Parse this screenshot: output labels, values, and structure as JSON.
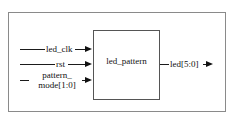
{
  "diagram": {
    "type": "block-diagram",
    "module": {
      "name": "led_pattern",
      "box": {
        "x": 93,
        "y": 30,
        "width": 67,
        "height": 70
      }
    },
    "frame": {
      "x": 8,
      "y": 12,
      "width": 218,
      "height": 100
    },
    "inputs": [
      {
        "name": "led_clk",
        "label": "led_clk",
        "line1": "led_clk",
        "line2": "",
        "y": 49,
        "direction": "in"
      },
      {
        "name": "rst",
        "label": "rst",
        "line1": "rst",
        "line2": "",
        "y": 64,
        "direction": "in"
      },
      {
        "name": "pattern_mode",
        "label": "pattern_mode[1:0]",
        "line1": "pattern_",
        "line2": "mode[1:0]",
        "y": 80,
        "direction": "in"
      }
    ],
    "outputs": [
      {
        "name": "led",
        "label": "led[5:0]",
        "line1": "led[5:0]",
        "y": 64,
        "direction": "out"
      }
    ],
    "colors": {
      "background": "#ffffff",
      "frame_stroke": "#8a8a8a",
      "box_stroke": "#555555",
      "line_stroke": "#1b1b1b",
      "text": "#101010"
    }
  }
}
